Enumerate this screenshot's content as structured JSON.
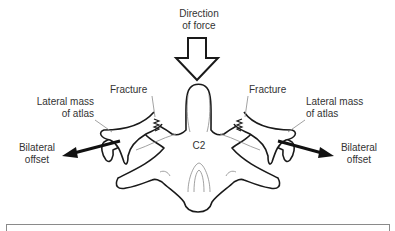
{
  "figure": {
    "labels": {
      "direction_of_force": [
        "Direction",
        "of force"
      ],
      "fracture_left": "Fracture",
      "fracture_right": "Fracture",
      "lateral_mass_left": [
        "Lateral mass",
        "of atlas"
      ],
      "lateral_mass_right": [
        "Lateral mass",
        "of atlas"
      ],
      "bilateral_offset_left": [
        "Bilateral",
        "offset"
      ],
      "bilateral_offset_right": [
        "Bilateral",
        "offset"
      ],
      "vertebra": "C2"
    },
    "colors": {
      "outline": "#1a1a1a",
      "thin_line": "#8a8a8a",
      "text": "#333333",
      "background": "#ffffff"
    }
  },
  "caption_box": {
    "text": ""
  }
}
